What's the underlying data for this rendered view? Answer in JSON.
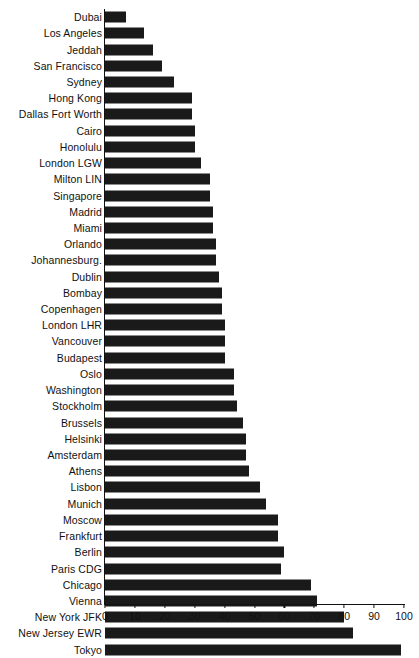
{
  "chart_data": {
    "type": "bar",
    "orientation": "horizontal",
    "title": "",
    "xlabel": "",
    "ylabel": "",
    "xlim": [
      0,
      100
    ],
    "grid": false,
    "legend": null,
    "xticks": [
      0,
      10,
      20,
      30,
      40,
      50,
      60,
      70,
      80,
      90,
      100
    ],
    "xtick_labels": [
      "0",
      "10",
      "20",
      "30",
      "40",
      "50",
      "60",
      "70",
      "80",
      "90",
      "100"
    ],
    "bar_color": "#1a1a1a",
    "categories": [
      "Dubai",
      "Los Angeles",
      "Jeddah",
      "San Francisco",
      "Sydney",
      "Hong Kong",
      "Dallas Fort Worth",
      "Cairo",
      "Honolulu",
      "London LGW",
      "Milton LIN",
      "Singapore",
      "Madrid",
      "Miami",
      "Orlando",
      "Johannesburg.",
      "Dublin",
      "Bombay",
      "Copenhagen",
      "London LHR",
      "Vancouver",
      "Budapest",
      "Oslo",
      "Washington",
      "Stockholm",
      "Brussels",
      "Helsinki",
      "Amsterdam",
      "Athens",
      "Lisbon",
      "Munich",
      "Moscow",
      "Frankfurt",
      "Berlin",
      "Paris CDG",
      "Chicago",
      "Vienna",
      "New York JFK",
      "New Jersey EWR",
      "Tokyo"
    ],
    "values": [
      7,
      13,
      16,
      19,
      23,
      29,
      29,
      30,
      30,
      32,
      35,
      35,
      36,
      36,
      37,
      37,
      38,
      39,
      39,
      40,
      40,
      40,
      43,
      43,
      44,
      46,
      47,
      47,
      48,
      52,
      54,
      58,
      58,
      60,
      59,
      69,
      71,
      80,
      83,
      99
    ]
  }
}
